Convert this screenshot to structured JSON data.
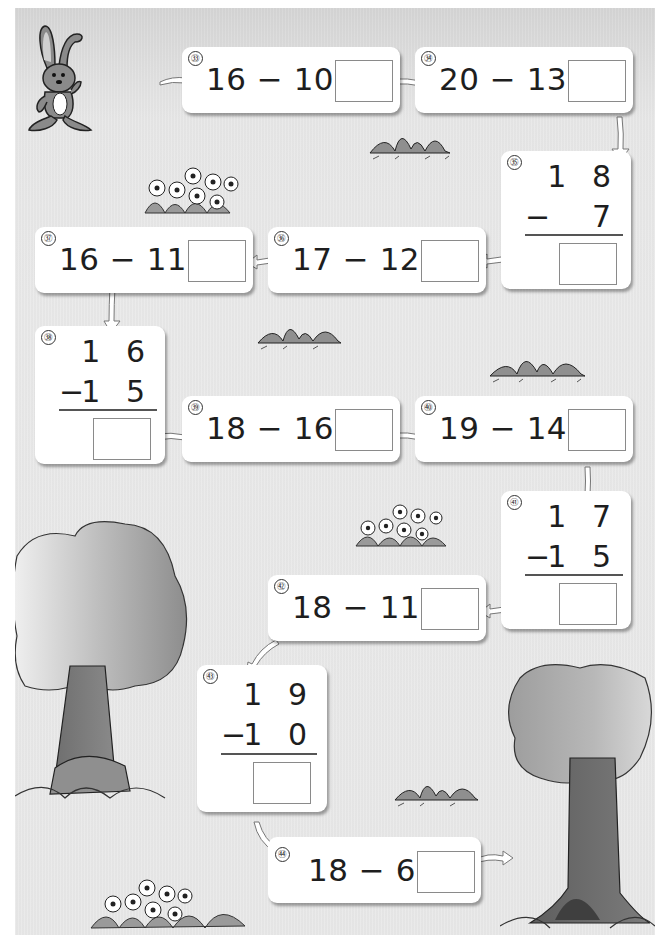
{
  "worksheet": {
    "topic": "Subtraction within 20",
    "problems": [
      {
        "id": "33",
        "label": "㉝",
        "layout": "horizontal",
        "expression": "16 − 10 =",
        "minuend": "16",
        "subtrahend": "10",
        "answer": ""
      },
      {
        "id": "34",
        "label": "㉞",
        "layout": "horizontal",
        "expression": "20 − 13 =",
        "minuend": "20",
        "subtrahend": "13",
        "answer": ""
      },
      {
        "id": "35",
        "label": "㉟",
        "layout": "vertical",
        "top": "1 8",
        "operator": "−",
        "bottom": "7",
        "minuend": "18",
        "subtrahend": "7",
        "answer": ""
      },
      {
        "id": "36",
        "label": "㊱",
        "layout": "horizontal",
        "expression": "17 − 12 =",
        "minuend": "17",
        "subtrahend": "12",
        "answer": ""
      },
      {
        "id": "37",
        "label": "㊲",
        "layout": "horizontal",
        "expression": "16 − 11 =",
        "minuend": "16",
        "subtrahend": "11",
        "answer": ""
      },
      {
        "id": "38",
        "label": "㊳",
        "layout": "vertical",
        "top": "1 6",
        "operator": "−",
        "bottom": "1 5",
        "minuend": "16",
        "subtrahend": "15",
        "answer": ""
      },
      {
        "id": "39",
        "label": "㊴",
        "layout": "horizontal",
        "expression": "18 − 16 =",
        "minuend": "18",
        "subtrahend": "16",
        "answer": ""
      },
      {
        "id": "40",
        "label": "㊵",
        "layout": "horizontal",
        "expression": "19 − 14 =",
        "minuend": "19",
        "subtrahend": "14",
        "answer": ""
      },
      {
        "id": "41",
        "label": "㊶",
        "layout": "vertical",
        "top": "1 7",
        "operator": "−",
        "bottom": "1 5",
        "minuend": "17",
        "subtrahend": "15",
        "answer": ""
      },
      {
        "id": "42",
        "label": "㊷",
        "layout": "horizontal",
        "expression": "18 − 11 =",
        "minuend": "18",
        "subtrahend": "11",
        "answer": ""
      },
      {
        "id": "43",
        "label": "㊸",
        "layout": "vertical",
        "top": "1 9",
        "operator": "−",
        "bottom": "1 0",
        "minuend": "19",
        "subtrahend": "10",
        "answer": ""
      },
      {
        "id": "44",
        "label": "㊹",
        "layout": "horizontal",
        "expression": "18 − 6 =",
        "minuend": "18",
        "subtrahend": "6",
        "answer": ""
      }
    ],
    "path_order": [
      "33",
      "34",
      "35",
      "36",
      "37",
      "38",
      "39",
      "40",
      "41",
      "42",
      "43",
      "44"
    ],
    "illustrations": [
      "rabbit",
      "flower-bush",
      "grass-tuft",
      "tree-left",
      "tree-right"
    ]
  },
  "colors": {
    "page_bg": "#e8e8e8",
    "card_bg": "#ffffff",
    "text": "#1e1e1e",
    "answer_border": "#8a8a8a",
    "art_gray": "#7a7a7a"
  }
}
